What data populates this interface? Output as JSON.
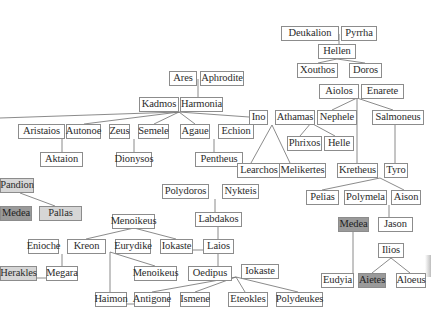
{
  "diagram": {
    "title": "",
    "type": "family-tree",
    "nodes": [
      {
        "id": "deukalion",
        "label": "Deukalion",
        "x": 281,
        "y": 26,
        "w": 58,
        "style": "plain"
      },
      {
        "id": "pyrrha",
        "label": "Pyrrha",
        "x": 341,
        "y": 26,
        "w": 36,
        "style": "plain"
      },
      {
        "id": "hellen",
        "label": "Hellen",
        "x": 318,
        "y": 44,
        "w": 38,
        "style": "plain"
      },
      {
        "id": "xouthos",
        "label": "Xouthos",
        "x": 297,
        "y": 63,
        "w": 41,
        "style": "plain"
      },
      {
        "id": "doros",
        "label": "Doros",
        "x": 349,
        "y": 63,
        "w": 33,
        "style": "plain"
      },
      {
        "id": "aiolos",
        "label": "Aiolos",
        "x": 319,
        "y": 84,
        "w": 40,
        "style": "plain"
      },
      {
        "id": "enarete",
        "label": "Enarete",
        "x": 361,
        "y": 84,
        "w": 43,
        "style": "plain"
      },
      {
        "id": "ares",
        "label": "Ares",
        "x": 169,
        "y": 71,
        "w": 28,
        "style": "plain"
      },
      {
        "id": "aphrodite",
        "label": "Aphrodite",
        "x": 200,
        "y": 71,
        "w": 44,
        "style": "plain"
      },
      {
        "id": "kadmos",
        "label": "Kadmos",
        "x": 139,
        "y": 97,
        "w": 40,
        "style": "plain"
      },
      {
        "id": "harmonia",
        "label": "Harmonia",
        "x": 180,
        "y": 97,
        "w": 43,
        "style": "plain"
      },
      {
        "id": "ino",
        "label": "Ino",
        "x": 249,
        "y": 110,
        "w": 19,
        "style": "plain"
      },
      {
        "id": "athamas",
        "label": "Athamas",
        "x": 275,
        "y": 110,
        "w": 40,
        "style": "plain"
      },
      {
        "id": "nephele",
        "label": "Nephele",
        "x": 317,
        "y": 110,
        "w": 40,
        "style": "plain"
      },
      {
        "id": "salmoneus",
        "label": "Salmoneus",
        "x": 372,
        "y": 110,
        "w": 52,
        "style": "plain"
      },
      {
        "id": "aristaios",
        "label": "Aristaios",
        "x": 18,
        "y": 124,
        "w": 47,
        "style": "plain"
      },
      {
        "id": "autonoe",
        "label": "Autonoe",
        "x": 66,
        "y": 124,
        "w": 35,
        "style": "plain"
      },
      {
        "id": "zeus",
        "label": "Zeus",
        "x": 109,
        "y": 124,
        "w": 21,
        "style": "plain"
      },
      {
        "id": "semele",
        "label": "Semele",
        "x": 138,
        "y": 124,
        "w": 31,
        "style": "plain"
      },
      {
        "id": "agaue",
        "label": "Agaue",
        "x": 180,
        "y": 124,
        "w": 30,
        "style": "plain"
      },
      {
        "id": "echion",
        "label": "Echion",
        "x": 218,
        "y": 124,
        "w": 36,
        "style": "plain"
      },
      {
        "id": "phrixos",
        "label": "Phrixos",
        "x": 287,
        "y": 136,
        "w": 35,
        "style": "plain"
      },
      {
        "id": "helle",
        "label": "Helle",
        "x": 324,
        "y": 136,
        "w": 30,
        "style": "plain"
      },
      {
        "id": "aktaion",
        "label": "Aktaion",
        "x": 40,
        "y": 152,
        "w": 43,
        "style": "plain"
      },
      {
        "id": "dionysos",
        "label": "Dionysos",
        "x": 116,
        "y": 152,
        "w": 36,
        "style": "plain"
      },
      {
        "id": "pentheus",
        "label": "Pentheus",
        "x": 195,
        "y": 152,
        "w": 48,
        "style": "plain"
      },
      {
        "id": "learchos",
        "label": "Learchos",
        "x": 237,
        "y": 163,
        "w": 44,
        "style": "plain"
      },
      {
        "id": "melikertes",
        "label": "Melikertes",
        "x": 279,
        "y": 163,
        "w": 47,
        "style": "plain"
      },
      {
        "id": "kretheus",
        "label": "Kretheus",
        "x": 337,
        "y": 163,
        "w": 41,
        "style": "plain"
      },
      {
        "id": "tyro",
        "label": "Tyro",
        "x": 384,
        "y": 163,
        "w": 24,
        "style": "plain"
      },
      {
        "id": "pandion",
        "label": "Pandion",
        "x": 0,
        "y": 178,
        "w": 34,
        "style": "gray-light"
      },
      {
        "id": "polydoros",
        "label": "Polydoros",
        "x": 162,
        "y": 184,
        "w": 47,
        "style": "plain"
      },
      {
        "id": "nykteis",
        "label": "Nykteis",
        "x": 222,
        "y": 184,
        "w": 37,
        "style": "plain"
      },
      {
        "id": "pelias",
        "label": "Pelias",
        "x": 306,
        "y": 190,
        "w": 33,
        "style": "plain"
      },
      {
        "id": "polymela",
        "label": "Polymela",
        "x": 344,
        "y": 190,
        "w": 43,
        "style": "plain"
      },
      {
        "id": "aison",
        "label": "Aison",
        "x": 391,
        "y": 190,
        "w": 30,
        "style": "plain"
      },
      {
        "id": "medea_left",
        "label": "Medea",
        "x": 0,
        "y": 206,
        "w": 32,
        "style": "gray-dark"
      },
      {
        "id": "pallas",
        "label": "Pallas",
        "x": 39,
        "y": 206,
        "w": 43,
        "style": "gray-light"
      },
      {
        "id": "menoikeus_top",
        "label": "Menoikeus",
        "x": 112,
        "y": 214,
        "w": 43,
        "style": "plain"
      },
      {
        "id": "labdakos",
        "label": "Labdakos",
        "x": 195,
        "y": 212,
        "w": 47,
        "style": "plain"
      },
      {
        "id": "medea_right",
        "label": "Medea",
        "x": 338,
        "y": 217,
        "w": 31,
        "style": "gray-dark"
      },
      {
        "id": "jason",
        "label": "Jason",
        "x": 378,
        "y": 217,
        "w": 35,
        "style": "plain"
      },
      {
        "id": "enioche",
        "label": "Enioche",
        "x": 28,
        "y": 239,
        "w": 31,
        "style": "plain"
      },
      {
        "id": "kreon",
        "label": "Kreon",
        "x": 67,
        "y": 239,
        "w": 39,
        "style": "plain"
      },
      {
        "id": "eurydike",
        "label": "Eurydike",
        "x": 115,
        "y": 239,
        "w": 36,
        "style": "plain"
      },
      {
        "id": "iokaste_mid",
        "label": "Iokaste",
        "x": 160,
        "y": 239,
        "w": 33,
        "style": "plain"
      },
      {
        "id": "laios",
        "label": "Laios",
        "x": 203,
        "y": 239,
        "w": 31,
        "style": "plain"
      },
      {
        "id": "ilios",
        "label": "Ilios",
        "x": 378,
        "y": 243,
        "w": 26,
        "style": "plain"
      },
      {
        "id": "herakles",
        "label": "Herakles",
        "x": 0,
        "y": 266,
        "w": 37,
        "style": "gray-light"
      },
      {
        "id": "megara",
        "label": "Megara",
        "x": 46,
        "y": 266,
        "w": 32,
        "style": "plain"
      },
      {
        "id": "menoikeus_bottom",
        "label": "Menoikeus",
        "x": 134,
        "y": 266,
        "w": 43,
        "style": "plain"
      },
      {
        "id": "oedipus",
        "label": "Oedipus",
        "x": 188,
        "y": 266,
        "w": 44,
        "style": "plain"
      },
      {
        "id": "iokaste_bottom",
        "label": "Iokaste",
        "x": 241,
        "y": 264,
        "w": 38,
        "style": "plain"
      },
      {
        "id": "eudyia",
        "label": "Eudyia",
        "x": 321,
        "y": 273,
        "w": 33,
        "style": "plain"
      },
      {
        "id": "aietes",
        "label": "Aietes",
        "x": 358,
        "y": 273,
        "w": 28,
        "style": "gray-dark"
      },
      {
        "id": "aloeus",
        "label": "Aloeus",
        "x": 396,
        "y": 273,
        "w": 30,
        "style": "plain"
      },
      {
        "id": "haimon",
        "label": "Haimon",
        "x": 95,
        "y": 292,
        "w": 32,
        "style": "plain"
      },
      {
        "id": "antigone",
        "label": "Antigone",
        "x": 134,
        "y": 292,
        "w": 36,
        "style": "plain"
      },
      {
        "id": "ismene",
        "label": "Ismene",
        "x": 180,
        "y": 292,
        "w": 30,
        "style": "plain"
      },
      {
        "id": "eteokles",
        "label": "Eteokles",
        "x": 228,
        "y": 292,
        "w": 40,
        "style": "plain"
      },
      {
        "id": "polydeukes",
        "label": "Polydeukes",
        "x": 276,
        "y": 292,
        "w": 47,
        "style": "plain"
      }
    ],
    "edges": [
      {
        "from": "deukalion-pyrrha",
        "points": [
          [
            339,
            34
          ],
          [
            339,
            44
          ]
        ]
      },
      {
        "from": "hellen",
        "to": "xouthos",
        "points": [
          [
            337,
            59
          ],
          [
            318,
            63
          ]
        ]
      },
      {
        "from": "hellen",
        "to": "doros",
        "points": [
          [
            337,
            59
          ],
          [
            365,
            63
          ]
        ]
      },
      {
        "from": "ares-aphrodite",
        "points": [
          [
            198,
            79
          ],
          [
            198,
            97
          ]
        ]
      },
      {
        "from": "kadmos-harmonia",
        "to": "trunk-left",
        "points": [
          [
            179,
            112
          ],
          [
            0,
            118
          ]
        ]
      },
      {
        "from": "kadmos-harmonia",
        "to": "autonoe",
        "points": [
          [
            179,
            112
          ],
          [
            84,
            124
          ]
        ]
      },
      {
        "from": "kadmos-harmonia",
        "to": "semele",
        "points": [
          [
            179,
            112
          ],
          [
            154,
            124
          ]
        ]
      },
      {
        "from": "kadmos-harmonia",
        "to": "agaue",
        "points": [
          [
            179,
            112
          ],
          [
            195,
            124
          ]
        ]
      },
      {
        "from": "kadmos-harmonia",
        "to": "ino",
        "points": [
          [
            179,
            112
          ],
          [
            249,
            117
          ]
        ]
      },
      {
        "from": "aristaios-autonoe",
        "to": "aktaion",
        "points": [
          [
            62,
            139
          ],
          [
            62,
            152
          ]
        ]
      },
      {
        "from": "zeus-semele",
        "to": "dionysos",
        "points": [
          [
            134,
            139
          ],
          [
            134,
            152
          ]
        ]
      },
      {
        "from": "agaue-echion",
        "to": "pentheus",
        "points": [
          [
            214,
            139
          ],
          [
            214,
            152
          ]
        ]
      },
      {
        "from": "ino-athamas",
        "to": "learchos",
        "points": [
          [
            272,
            125
          ],
          [
            251,
            163
          ]
        ]
      },
      {
        "from": "ino-athamas",
        "to": "melikertes",
        "points": [
          [
            272,
            125
          ],
          [
            290,
            163
          ]
        ]
      },
      {
        "from": "aiolos-enarete",
        "to": "nephele",
        "points": [
          [
            357,
            98
          ],
          [
            332,
            110
          ]
        ]
      },
      {
        "from": "aiolos-enarete",
        "to": "kretheus",
        "points": [
          [
            357,
            98
          ],
          [
            357,
            163
          ]
        ]
      },
      {
        "from": "aiolos-enarete",
        "to": "salmoneus",
        "points": [
          [
            357,
            98
          ],
          [
            393,
            110
          ]
        ]
      },
      {
        "from": "athamas-nephele",
        "to": "phrixos",
        "points": [
          [
            311,
            123
          ],
          [
            300,
            136
          ]
        ]
      },
      {
        "from": "athamas-nephele",
        "to": "helle",
        "points": [
          [
            311,
            123
          ],
          [
            335,
            136
          ]
        ]
      },
      {
        "from": "salmoneus",
        "to": "tyro",
        "points": [
          [
            395,
            125
          ],
          [
            395,
            163
          ]
        ]
      },
      {
        "from": "kretheus-tyro",
        "to": "pelias",
        "points": [
          [
            380,
            178
          ],
          [
            322,
            190
          ]
        ]
      },
      {
        "from": "kretheus-tyro",
        "to": "aison",
        "points": [
          [
            380,
            178
          ],
          [
            404,
            190
          ]
        ]
      },
      {
        "from": "polymela-aison",
        "to": "jason",
        "points": [
          [
            389,
            205
          ],
          [
            389,
            217
          ]
        ]
      },
      {
        "from": "medea-jason",
        "to": "eudyia",
        "points": [
          [
            353,
            232
          ],
          [
            353,
            273
          ]
        ]
      },
      {
        "from": "ilios",
        "to": "aietes",
        "points": [
          [
            391,
            258
          ],
          [
            372,
            273
          ]
        ]
      },
      {
        "from": "ilios",
        "to": "aloeus",
        "points": [
          [
            391,
            258
          ],
          [
            410,
            273
          ]
        ]
      },
      {
        "from": "pandion",
        "to": "pallas",
        "points": [
          [
            20,
            193
          ],
          [
            55,
            206
          ]
        ]
      },
      {
        "from": "polydoros-nykteis",
        "to": "labdakos",
        "points": [
          [
            215,
            199
          ],
          [
            215,
            212
          ]
        ]
      },
      {
        "from": "labdakos",
        "to": "laios",
        "points": [
          [
            218,
            227
          ],
          [
            218,
            239
          ]
        ]
      },
      {
        "from": "laios",
        "to": "oedipus",
        "points": [
          [
            218,
            254
          ],
          [
            218,
            266
          ]
        ]
      },
      {
        "from": "iokaste_mid-laios",
        "points": [
          [
            193,
            250
          ],
          [
            203,
            250
          ]
        ]
      },
      {
        "from": "menoikeus_top",
        "to": "kreon",
        "points": [
          [
            134,
            228
          ],
          [
            86,
            239
          ]
        ]
      },
      {
        "from": "menoikeus_top",
        "to": "iokaste_mid",
        "points": [
          [
            134,
            228
          ],
          [
            176,
            239
          ]
        ]
      },
      {
        "from": "enioche-kreon",
        "to": "megara",
        "points": [
          [
            62,
            254
          ],
          [
            62,
            266
          ]
        ]
      },
      {
        "from": "herakles-megara",
        "points": [
          [
            37,
            278
          ],
          [
            46,
            278
          ]
        ]
      },
      {
        "from": "kreon-eurydike",
        "to": "menoikeus_bottom",
        "points": [
          [
            110,
            252
          ],
          [
            155,
            266
          ]
        ]
      },
      {
        "from": "kreon-eurydike",
        "to": "haimon",
        "points": [
          [
            110,
            252
          ],
          [
            110,
            292
          ]
        ]
      },
      {
        "from": "oedipus-iokaste",
        "to": "antigone",
        "points": [
          [
            236,
            277
          ],
          [
            152,
            292
          ]
        ]
      },
      {
        "from": "oedipus-iokaste",
        "to": "ismene",
        "points": [
          [
            236,
            277
          ],
          [
            195,
            292
          ]
        ]
      },
      {
        "from": "oedipus-iokaste",
        "to": "eteokles",
        "points": [
          [
            236,
            277
          ],
          [
            245,
            292
          ]
        ]
      },
      {
        "from": "oedipus-iokaste",
        "to": "polydeukes",
        "points": [
          [
            236,
            277
          ],
          [
            298,
            292
          ]
        ]
      },
      {
        "from": "haimon-antigone",
        "points": [
          [
            127,
            304
          ],
          [
            134,
            304
          ]
        ]
      }
    ],
    "colors": {
      "border": "#8c8c8c",
      "line": "#6d6d6d",
      "highlight_dark": "#9a9a9a",
      "highlight_light": "#d6d6d6",
      "text": "#2b2b2b",
      "background": "#ffffff"
    }
  }
}
